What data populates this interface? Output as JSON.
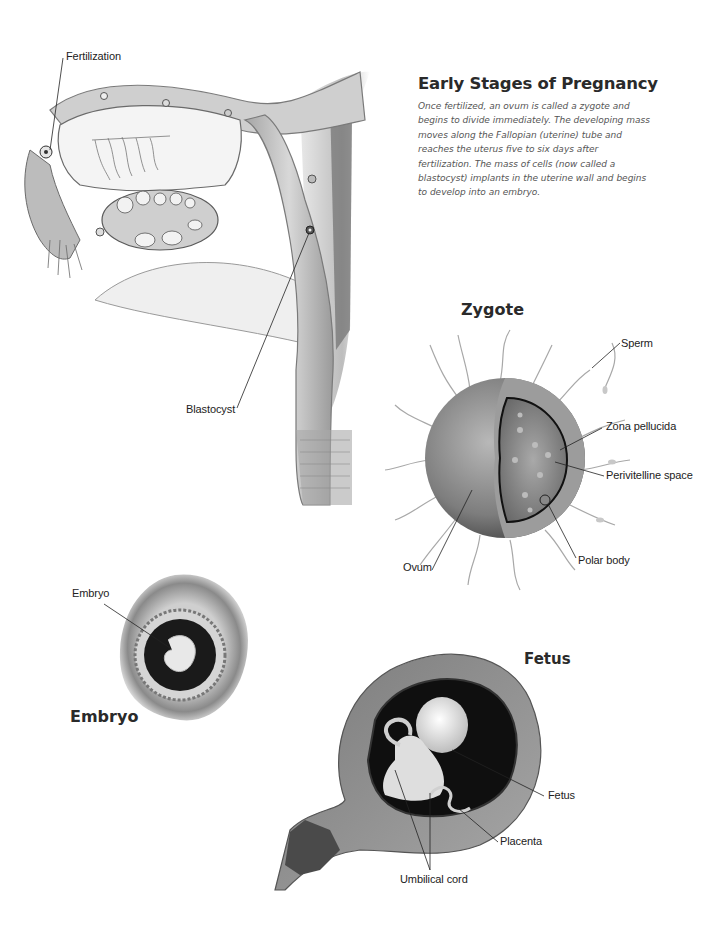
{
  "header": {
    "title": "Early Stages of Pregnancy",
    "intro": "Once fertilized, an ovum is called a zygote and begins to divide immediately. The developing mass moves along the Fallopian (uterine) tube and reaches the uterus five to six days after fertilization. The mass of cells (now called a blastocyst) implants in the uterine wall and begins to develop into an embryo."
  },
  "reproductive_tract": {
    "labels": {
      "fertilization": "Fertilization",
      "blastocyst": "Blastocyst"
    }
  },
  "zygote": {
    "title": "Zygote",
    "labels": {
      "sperm": "Sperm",
      "zona_pellucida": "Zona pellucida",
      "perivitelline_space": "Perivitelline space",
      "polar_body": "Polar body",
      "ovum": "Ovum"
    }
  },
  "embryo": {
    "title": "Embryo",
    "labels": {
      "embryo": "Embryo"
    }
  },
  "fetus": {
    "title": "Fetus",
    "labels": {
      "fetus": "Fetus",
      "placenta": "Placenta",
      "umbilical_cord": "Umbilical cord"
    }
  },
  "colors": {
    "text": "#222222",
    "caption": "#555555",
    "tissue_light": "#d9d9d9",
    "tissue_mid": "#9a9a9a",
    "tissue_dark": "#3a3a3a"
  }
}
